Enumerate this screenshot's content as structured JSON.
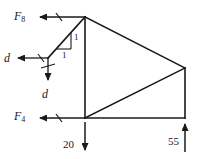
{
  "figure": {
    "type": "statics-truss-free-body-diagram",
    "colors": {
      "line": "#1a1a1a",
      "text": "#1a1a1a",
      "background": "#ffffff"
    },
    "labels": {
      "force_F8": "F",
      "force_F8_sub": "8",
      "force_F4": "F",
      "force_F4_sub": "4",
      "displacement_horizontal": "d",
      "displacement_vertical": "d",
      "slope_rise": "1",
      "slope_run": "1",
      "load_left": "20",
      "load_right": "55"
    },
    "geometry": {
      "nodes": {
        "top": [
          85,
          17
        ],
        "bottom_left": [
          85,
          118
        ],
        "bottom_right": [
          185,
          118
        ],
        "right": [
          185,
          68
        ],
        "left_joint": [
          48,
          58
        ]
      },
      "members": [
        "top-bottom_left",
        "top-right",
        "right-bottom_right",
        "bottom_left-bottom_right",
        "bottom_left-right",
        "top-left_joint"
      ]
    },
    "arrows": {
      "F8": {
        "direction": "left",
        "from": [
          85,
          17
        ],
        "to": [
          38,
          17
        ]
      },
      "F4": {
        "direction": "left",
        "from": [
          85,
          118
        ],
        "to": [
          38,
          118
        ]
      },
      "d_horizontal": {
        "direction": "left",
        "from": [
          48,
          58
        ],
        "to": [
          14,
          58
        ]
      },
      "d_vertical": {
        "direction": "down",
        "from": [
          48,
          58
        ],
        "to": [
          48,
          84
        ]
      },
      "load_20": {
        "direction": "down",
        "from": [
          85,
          122
        ],
        "to": [
          85,
          152
        ]
      },
      "load_55": {
        "direction": "up",
        "from": [
          185,
          152
        ],
        "to": [
          185,
          122
        ]
      }
    }
  }
}
